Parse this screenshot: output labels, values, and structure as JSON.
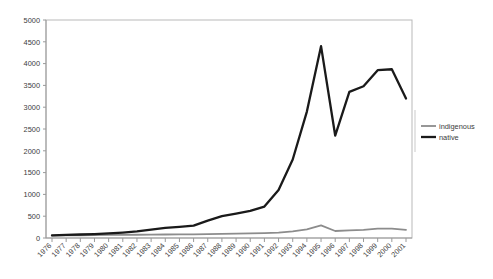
{
  "chart_data": {
    "type": "line",
    "title": "",
    "subtitle": "",
    "xlabel": "",
    "ylabel": "",
    "xlim": [
      1976,
      2001
    ],
    "ylim": [
      0,
      5000
    ],
    "ytick_step": 500,
    "grid": false,
    "legend_position": "right",
    "x": [
      1976,
      1977,
      1978,
      1979,
      1980,
      1981,
      1982,
      1983,
      1984,
      1985,
      1986,
      1987,
      1988,
      1989,
      1990,
      1991,
      1992,
      1993,
      1994,
      1995,
      1996,
      1997,
      1998,
      1999,
      2000,
      2001
    ],
    "xtick_labels": [
      "1976",
      "1977",
      "1978",
      "1979",
      "1980",
      "1981",
      "1982",
      "1983",
      "1984",
      "1985",
      "1986",
      "1987",
      "1988",
      "1989",
      "1990",
      "1991",
      "1992",
      "1993",
      "1994",
      "1995",
      "1996",
      "1997",
      "1998",
      "1999",
      "2000",
      "2001"
    ],
    "ytick_labels": [
      "0",
      "500",
      "1000",
      "1500",
      "2000",
      "2500",
      "3000",
      "3500",
      "4000",
      "4500",
      "5000"
    ],
    "ytick_values": [
      0,
      500,
      1000,
      1500,
      2000,
      2500,
      3000,
      3500,
      4000,
      4500,
      5000
    ],
    "series": [
      {
        "name": "indigenous",
        "color": "#8c8c8c",
        "width": 1.8,
        "values": [
          55,
          60,
          62,
          65,
          70,
          72,
          75,
          78,
          80,
          82,
          85,
          90,
          95,
          100,
          105,
          112,
          125,
          150,
          200,
          290,
          160,
          175,
          185,
          215,
          215,
          185
        ]
      },
      {
        "name": "native",
        "color": "#1a1a1a",
        "width": 2.3,
        "values": [
          60,
          70,
          80,
          90,
          105,
          125,
          150,
          190,
          230,
          255,
          285,
          400,
          500,
          560,
          620,
          720,
          1100,
          1800,
          2900,
          4400,
          2350,
          3350,
          3480,
          3850,
          3870,
          3200
        ]
      }
    ]
  },
  "legend": {
    "entries": [
      {
        "label": "indigenous",
        "color": "#8c8c8c"
      },
      {
        "label": "native",
        "color": "#1a1a1a"
      }
    ]
  }
}
